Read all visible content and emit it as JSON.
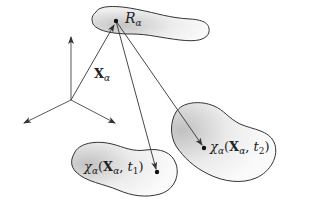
{
  "diagram": {
    "type": "continuum-kinematics-mapping",
    "colors": {
      "stroke": "#333333",
      "region_fill_light": "#f4f4f4",
      "region_fill_dark": "#c8c8c8",
      "text": "#222222"
    },
    "axes": {
      "origin": [
        71,
        100
      ],
      "ends": {
        "up": [
          71,
          35
        ],
        "left": [
          22,
          124
        ],
        "right": [
          117,
          124
        ]
      }
    },
    "reference_region": {
      "label_main": "R",
      "label_sub": "α",
      "point": [
        116,
        21
      ]
    },
    "position_vector": {
      "label_main": "X",
      "label_sub": "α",
      "from": [
        71,
        100
      ],
      "to": [
        114,
        25
      ]
    },
    "region_t1": {
      "label_func": "χ",
      "label_sub": "α",
      "label_arg": "X",
      "label_arg_sub": "α",
      "label_time": "t",
      "label_time_sub": "1",
      "point": [
        157,
        172
      ]
    },
    "region_t2": {
      "label_func": "χ",
      "label_sub": "α",
      "label_arg": "X",
      "label_arg_sub": "α",
      "label_time": "t",
      "label_time_sub": "2",
      "point": [
        204,
        148
      ]
    }
  }
}
